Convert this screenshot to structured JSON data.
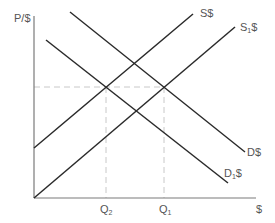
{
  "diagram": {
    "y_axis_label": "P/$",
    "x_axis_label": "$",
    "curves": [
      {
        "id": "S",
        "label_main": "S",
        "label_sub": "",
        "label_suffix": "$",
        "type": "supply"
      },
      {
        "id": "S1",
        "label_main": "S",
        "label_sub": "1",
        "label_suffix": "$",
        "type": "supply"
      },
      {
        "id": "D",
        "label_main": "D",
        "label_sub": "",
        "label_suffix": "$",
        "type": "demand"
      },
      {
        "id": "D1",
        "label_main": "D",
        "label_sub": "1",
        "label_suffix": "$",
        "type": "demand"
      }
    ],
    "ticks": [
      {
        "id": "Q2",
        "main": "Q",
        "sub": "2"
      },
      {
        "id": "Q1",
        "main": "Q",
        "sub": "1"
      }
    ],
    "colors": {
      "line": "#2a2a2a",
      "axis": "#7a7a7a",
      "dashed": "#c8c8c8",
      "text": "#555555"
    }
  }
}
